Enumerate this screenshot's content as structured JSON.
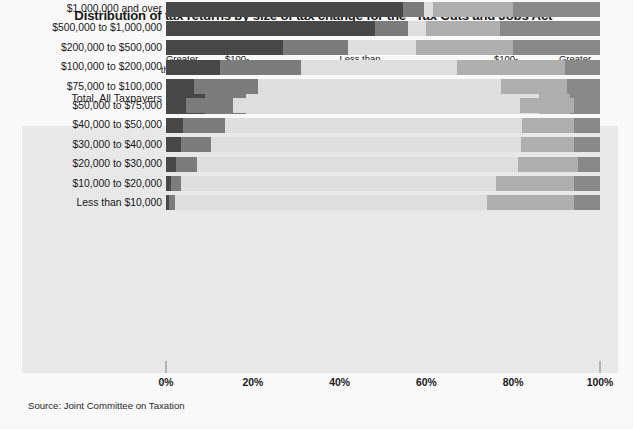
{
  "title": "Distribution of tax returns by size of tax change for the “Tax Cuts and Jobs Act”",
  "source": "Source: Joint Committee on Taxation",
  "total_row_label": "Total, All Taxpayers",
  "legend": {
    "groups": [
      {
        "title": "Tax Decrease",
        "subs": [
          "Greater\nthan $500",
          "$100-\n$500"
        ]
      },
      {
        "title": "Tax Change",
        "subs": [
          "Less than\n$100"
        ]
      },
      {
        "title": "Tax Increase",
        "subs": [
          "$100-\n$500",
          "Greater\nthan $500"
        ]
      }
    ],
    "g0_title": "Tax Decrease",
    "g0_s0_l1": "Greater",
    "g0_s0_l2": "than $500",
    "g0_s1_l1": "$100-",
    "g0_s1_l2": "$500",
    "g1_title": "Tax Change",
    "g1_s0_l1": "Less than",
    "g1_s0_l2": "$100",
    "g2_title": "Tax Increase",
    "g2_s0_l1": "$100-",
    "g2_s0_l2": "$500",
    "g2_s1_l1": "Greater",
    "g2_s1_l2": "than $500"
  },
  "colors": {
    "decrease_gt500": "#4a4a4a",
    "decrease_100_500": "#7f7f7f",
    "no_change": "#e4e4e4",
    "increase_100_500": "#b3b3b3",
    "increase_gt500": "#8c8c8c",
    "panel_bg": "#eeeeee",
    "tick": "#b8b8b8",
    "text": "#1a1a1a"
  },
  "chart_data": {
    "type": "bar",
    "orientation": "horizontal",
    "stacked": true,
    "stacked_percent": true,
    "title": "Distribution of tax returns by size of tax change for the “Tax Cuts and Jobs Act”",
    "xlabel": "",
    "ylabel": "",
    "xlim": [
      0,
      100
    ],
    "xticks": [
      0,
      20,
      40,
      60,
      80,
      100
    ],
    "xtick_labels": [
      "0%",
      "20%",
      "40%",
      "60%",
      "80%",
      "100%"
    ],
    "grid": false,
    "legend_position": "top",
    "series": [
      {
        "name": "Tax Decrease - Greater than $500",
        "color": "#4a4a4a",
        "values": [
          9.0,
          54.6,
          48.2,
          27.0,
          12.5,
          6.4,
          4.5,
          4.0,
          3.4,
          2.2,
          1.2,
          0.6
        ]
      },
      {
        "name": "Tax Decrease - $100-$500",
        "color": "#7f7f7f",
        "values": [
          9.4,
          4.8,
          7.5,
          15.0,
          18.5,
          14.8,
          11.0,
          9.5,
          7.0,
          5.0,
          2.3,
          1.4
        ]
      },
      {
        "name": "No Tax Change - Less than $100",
        "color": "#e4e4e4",
        "values": [
          67.6,
          2.1,
          4.3,
          15.6,
          36.0,
          56.1,
          66.0,
          68.5,
          71.5,
          73.8,
          72.5,
          72.0
        ]
      },
      {
        "name": "Tax Increase - $100-$500",
        "color": "#b3b3b3",
        "values": [
          7.0,
          18.5,
          17.0,
          22.4,
          25.0,
          15.0,
          12.5,
          12.0,
          12.1,
          14.0,
          18.0,
          20.0
        ]
      },
      {
        "name": "Tax Increase - Greater than $500",
        "color": "#8c8c8c",
        "values": [
          7.0,
          20.0,
          23.0,
          20.0,
          8.0,
          7.7,
          6.0,
          6.0,
          6.0,
          5.0,
          6.0,
          6.0
        ]
      }
    ],
    "categories": [
      "Total, All Taxpayers",
      "$1,000,000 and over",
      "$500,000 to $1,000,000",
      "$200,000 to $500,000",
      "$100,000 to $200,000",
      "$75,000 to $100,000",
      "$50,000 to $75,000",
      "$40,000 to $50,000",
      "$30,000 to $40,000",
      "$20,000 to $30,000",
      "$10,000 to $20,000",
      "Less than $10,000"
    ]
  },
  "rows": [
    {
      "label": "$1,000,000 and over",
      "segments": [
        54.6,
        4.8,
        2.1,
        18.5,
        20.0
      ]
    },
    {
      "label": "$500,000 to $1,000,000",
      "segments": [
        48.2,
        7.5,
        4.3,
        17.0,
        23.0
      ]
    },
    {
      "label": "$200,000 to $500,000",
      "segments": [
        27.0,
        15.0,
        15.6,
        22.4,
        20.0
      ]
    },
    {
      "label": "$100,000 to $200,000",
      "segments": [
        12.5,
        18.5,
        36.0,
        25.0,
        8.0
      ]
    },
    {
      "label": "$75,000 to $100,000",
      "segments": [
        6.4,
        14.8,
        56.1,
        15.0,
        7.7
      ]
    },
    {
      "label": "$50,000 to $75,000",
      "segments": [
        4.5,
        11.0,
        66.0,
        12.5,
        6.0
      ]
    },
    {
      "label": "$40,000 to $50,000",
      "segments": [
        4.0,
        9.5,
        68.5,
        12.0,
        6.0
      ]
    },
    {
      "label": "$30,000 to $40,000",
      "segments": [
        3.4,
        7.0,
        71.5,
        12.1,
        6.0
      ]
    },
    {
      "label": "$20,000 to $30,000",
      "segments": [
        2.2,
        5.0,
        73.8,
        14.0,
        5.0
      ]
    },
    {
      "label": "$10,000 to $20,000",
      "segments": [
        1.2,
        2.3,
        72.5,
        18.0,
        6.0
      ]
    },
    {
      "label": "Less than $10,000",
      "segments": [
        0.6,
        1.4,
        72.0,
        20.0,
        6.0
      ]
    }
  ],
  "total_segments": [
    9.0,
    9.4,
    67.6,
    7.0,
    7.0
  ],
  "axis": {
    "ticks": [
      {
        "label": "0%",
        "pos": 0
      },
      {
        "label": "20%",
        "pos": 20
      },
      {
        "label": "40%",
        "pos": 40
      },
      {
        "label": "60%",
        "pos": 60
      },
      {
        "label": "80%",
        "pos": 80
      },
      {
        "label": "100%",
        "pos": 100
      }
    ]
  }
}
